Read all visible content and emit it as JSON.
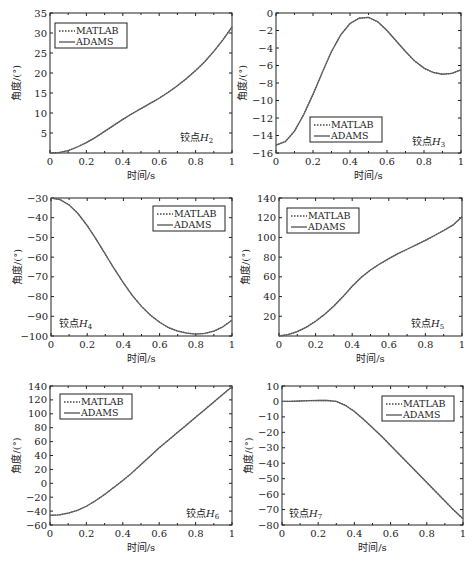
{
  "figure": {
    "legend_labels": [
      "MATLAB",
      "ADAMS"
    ],
    "xlabel": "时间/s",
    "ylabel": "角度/(°)",
    "colors": {
      "curve": "#666666",
      "axis": "#222222",
      "background": "#ffffff"
    }
  },
  "chart_data": [
    {
      "type": "line",
      "title": "铰点H2",
      "annotation": {
        "prefix": "铰点",
        "var": "H",
        "sub": "2"
      },
      "frame": [
        50,
        13,
        232,
        153
      ],
      "xlabel": "时间/s",
      "ylabel": "角度/(°)",
      "xlim": [
        0,
        1
      ],
      "ylim": [
        0,
        35
      ],
      "xticks": [
        0,
        0.2,
        0.4,
        0.6,
        0.8,
        1
      ],
      "yticks": [
        5,
        10,
        15,
        20,
        25,
        30,
        35
      ],
      "legend": {
        "position": "upper-left",
        "x": 55,
        "y": 23
      },
      "annotation_pos": {
        "x": 180,
        "y": 141
      },
      "x": [
        0,
        0.05,
        0.1,
        0.15,
        0.2,
        0.25,
        0.3,
        0.35,
        0.4,
        0.45,
        0.5,
        0.55,
        0.6,
        0.65,
        0.7,
        0.75,
        0.8,
        0.85,
        0.9,
        0.95,
        1.0
      ],
      "series": [
        {
          "name": "MATLAB",
          "values": [
            0,
            0.1,
            0.6,
            1.5,
            2.6,
            3.9,
            5.4,
            6.9,
            8.4,
            9.8,
            11.1,
            12.4,
            13.7,
            15.2,
            16.8,
            18.6,
            20.6,
            22.8,
            25.4,
            28.3,
            31.5
          ]
        },
        {
          "name": "ADAMS",
          "values": [
            0,
            0.1,
            0.6,
            1.5,
            2.6,
            3.9,
            5.4,
            6.9,
            8.4,
            9.8,
            11.1,
            12.4,
            13.7,
            15.2,
            16.8,
            18.6,
            20.6,
            22.8,
            25.4,
            28.3,
            31.5
          ]
        }
      ]
    },
    {
      "type": "line",
      "title": "铰点H3",
      "annotation": {
        "prefix": "铰点",
        "var": "H",
        "sub": "3"
      },
      "frame": [
        276,
        13,
        461,
        153
      ],
      "xlabel": "时间/s",
      "ylabel": "角度/(°)",
      "xlim": [
        0,
        1
      ],
      "ylim": [
        -16,
        0
      ],
      "xticks": [
        0,
        0.2,
        0.4,
        0.6,
        0.8,
        1
      ],
      "yticks": [
        -16,
        -14,
        -12,
        -10,
        -8,
        -6,
        -4,
        -2,
        0
      ],
      "legend": {
        "position": "lower-center",
        "x": 310,
        "y": 117
      },
      "annotation_pos": {
        "x": 412,
        "y": 145
      },
      "x": [
        0,
        0.05,
        0.1,
        0.15,
        0.2,
        0.25,
        0.3,
        0.35,
        0.4,
        0.45,
        0.5,
        0.55,
        0.6,
        0.65,
        0.7,
        0.75,
        0.8,
        0.85,
        0.9,
        0.95,
        1.0
      ],
      "series": [
        {
          "name": "MATLAB",
          "values": [
            -15.1,
            -14.7,
            -13.5,
            -11.6,
            -9.3,
            -6.8,
            -4.4,
            -2.5,
            -1.2,
            -0.6,
            -0.5,
            -1.0,
            -2.0,
            -3.2,
            -4.4,
            -5.5,
            -6.3,
            -6.8,
            -7.0,
            -6.9,
            -6.5
          ]
        },
        {
          "name": "ADAMS",
          "values": [
            -15.1,
            -14.7,
            -13.5,
            -11.6,
            -9.3,
            -6.8,
            -4.4,
            -2.5,
            -1.2,
            -0.6,
            -0.5,
            -1.0,
            -2.0,
            -3.2,
            -4.4,
            -5.5,
            -6.3,
            -6.8,
            -7.0,
            -6.9,
            -6.5
          ]
        }
      ]
    },
    {
      "type": "line",
      "title": "铰点H4",
      "annotation": {
        "prefix": "铰点",
        "var": "H",
        "sub": "4"
      },
      "frame": [
        51,
        198,
        232,
        336
      ],
      "xlabel": "时间/s",
      "ylabel": "角度/(°)",
      "xlim": [
        0,
        1
      ],
      "ylim": [
        -100,
        -30
      ],
      "xticks": [
        0,
        0.2,
        0.4,
        0.6,
        0.8,
        1
      ],
      "yticks": [
        -100,
        -90,
        -80,
        -70,
        -60,
        -50,
        -40,
        -30
      ],
      "legend": {
        "position": "upper-right",
        "x": 153,
        "y": 206
      },
      "annotation_pos": {
        "x": 59,
        "y": 327
      },
      "x": [
        0,
        0.05,
        0.1,
        0.15,
        0.2,
        0.25,
        0.3,
        0.35,
        0.4,
        0.45,
        0.5,
        0.55,
        0.6,
        0.65,
        0.7,
        0.75,
        0.8,
        0.85,
        0.9,
        0.95,
        1.0
      ],
      "series": [
        {
          "name": "MATLAB",
          "values": [
            -30,
            -30.8,
            -33.5,
            -38.0,
            -44.0,
            -51.0,
            -58.5,
            -66.0,
            -73.0,
            -79.5,
            -85.0,
            -89.5,
            -93.0,
            -95.8,
            -97.5,
            -98.5,
            -99.0,
            -98.7,
            -97.5,
            -95.3,
            -92.0
          ]
        },
        {
          "name": "ADAMS",
          "values": [
            -30,
            -30.8,
            -33.5,
            -38.0,
            -44.0,
            -51.0,
            -58.5,
            -66.0,
            -73.0,
            -79.5,
            -85.0,
            -89.5,
            -93.0,
            -95.8,
            -97.5,
            -98.5,
            -99.0,
            -98.7,
            -97.5,
            -95.3,
            -92.0
          ]
        }
      ]
    },
    {
      "type": "line",
      "title": "铰点H5",
      "annotation": {
        "prefix": "铰点",
        "var": "H",
        "sub": "5"
      },
      "frame": [
        279,
        198,
        462,
        336
      ],
      "xlabel": "时间/s",
      "ylabel": "角度/(°)",
      "xlim": [
        0,
        1
      ],
      "ylim": [
        0,
        140
      ],
      "xticks": [
        0,
        0.2,
        0.4,
        0.6,
        0.8,
        1
      ],
      "yticks": [
        20,
        40,
        60,
        80,
        100,
        120,
        140
      ],
      "legend": {
        "position": "upper-left",
        "x": 287,
        "y": 208
      },
      "annotation_pos": {
        "x": 411,
        "y": 327
      },
      "x": [
        0,
        0.05,
        0.1,
        0.15,
        0.2,
        0.25,
        0.3,
        0.35,
        0.4,
        0.45,
        0.5,
        0.55,
        0.6,
        0.65,
        0.7,
        0.75,
        0.8,
        0.85,
        0.9,
        0.95,
        1.0
      ],
      "series": [
        {
          "name": "MATLAB",
          "values": [
            0,
            1.5,
            4.5,
            9.0,
            15.0,
            22.0,
            30.5,
            40.0,
            50.5,
            59.5,
            67.0,
            73.0,
            78.5,
            83.5,
            88.0,
            92.5,
            97.0,
            102.0,
            107.0,
            112.5,
            121.0
          ]
        },
        {
          "name": "ADAMS",
          "values": [
            0,
            1.5,
            4.5,
            9.0,
            15.0,
            22.0,
            30.5,
            40.0,
            50.5,
            59.5,
            67.0,
            73.0,
            78.5,
            83.5,
            88.0,
            92.5,
            97.0,
            102.0,
            107.0,
            112.5,
            121.0
          ]
        }
      ]
    },
    {
      "type": "line",
      "title": "铰点H6",
      "annotation": {
        "prefix": "铰点",
        "var": "H",
        "sub": "6"
      },
      "frame": [
        50,
        386,
        232,
        525
      ],
      "xlabel": "时间/s",
      "ylabel": "角度/(°)",
      "xlim": [
        0,
        1
      ],
      "ylim": [
        -60,
        140
      ],
      "xticks": [
        0,
        0.2,
        0.4,
        0.6,
        0.8,
        1
      ],
      "yticks": [
        -60,
        -40,
        -20,
        0,
        20,
        40,
        60,
        80,
        100,
        120,
        140
      ],
      "legend": {
        "position": "upper-left",
        "x": 60,
        "y": 394
      },
      "annotation_pos": {
        "x": 186,
        "y": 517
      },
      "x": [
        0,
        0.05,
        0.1,
        0.15,
        0.2,
        0.25,
        0.3,
        0.35,
        0.4,
        0.45,
        0.5,
        0.55,
        0.6,
        0.65,
        0.7,
        0.75,
        0.8,
        0.85,
        0.9,
        0.95,
        1.0
      ],
      "series": [
        {
          "name": "MATLAB",
          "values": [
            -46,
            -45.5,
            -43,
            -39,
            -33,
            -25,
            -16,
            -6,
            4,
            15,
            27,
            39,
            51,
            62,
            73,
            84,
            95,
            106,
            117,
            128,
            139
          ]
        },
        {
          "name": "ADAMS",
          "values": [
            -46,
            -45.5,
            -43,
            -39,
            -33,
            -25,
            -16,
            -6,
            4,
            15,
            27,
            39,
            51,
            62,
            73,
            84,
            95,
            106,
            117,
            128,
            139
          ]
        }
      ]
    },
    {
      "type": "line",
      "title": "铰点H7",
      "annotation": {
        "prefix": "铰点",
        "var": "H",
        "sub": "7"
      },
      "frame": [
        282,
        386,
        463,
        525
      ],
      "xlabel": "时间/s",
      "ylabel": "角度/(°)",
      "xlim": [
        0,
        1
      ],
      "ylim": [
        -80,
        10
      ],
      "xticks": [
        0,
        0.2,
        0.4,
        0.6,
        0.8,
        1
      ],
      "yticks": [
        -80,
        -70,
        -60,
        -50,
        -40,
        -30,
        -20,
        -10,
        0,
        10
      ],
      "legend": {
        "position": "upper-right",
        "x": 382,
        "y": 396
      },
      "annotation_pos": {
        "x": 289,
        "y": 517
      },
      "x": [
        0,
        0.05,
        0.1,
        0.15,
        0.2,
        0.25,
        0.3,
        0.35,
        0.4,
        0.45,
        0.5,
        0.55,
        0.6,
        0.65,
        0.7,
        0.75,
        0.8,
        0.85,
        0.9,
        0.95,
        1.0
      ],
      "series": [
        {
          "name": "MATLAB",
          "values": [
            0,
            0.1,
            0.3,
            0.5,
            0.6,
            0.6,
            0,
            -2.5,
            -6.5,
            -11.5,
            -17,
            -22.5,
            -28.5,
            -34.5,
            -40.5,
            -46.5,
            -52.5,
            -58.5,
            -64.5,
            -70.5,
            -76
          ]
        },
        {
          "name": "ADAMS",
          "values": [
            0,
            0.1,
            0.3,
            0.5,
            0.6,
            0.6,
            0,
            -2.5,
            -6.5,
            -11.5,
            -17,
            -22.5,
            -28.5,
            -34.5,
            -40.5,
            -46.5,
            -52.5,
            -58.5,
            -64.5,
            -70.5,
            -76
          ]
        }
      ]
    }
  ]
}
